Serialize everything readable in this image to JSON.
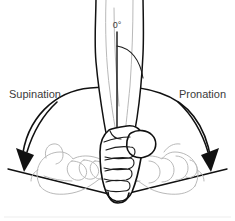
{
  "figure": {
    "background_color": "#ffffff",
    "line_color": "#111111",
    "ghost_color": "#b9b9b9",
    "text_color": "#3b3b3b"
  },
  "labels": {
    "left_motion": "Supination",
    "right_motion": "Pronation",
    "neutral_angle": "0°"
  },
  "annotations": {
    "neutral_axis_name": "vertical neutral reference line",
    "arc_name": "rotation range arc",
    "baseline_name": "horizontal ground reference line"
  },
  "anatomy": {
    "forearm": "forearm",
    "center_hand": "neutral-position fist",
    "left_hand": "supinated hand, palm up",
    "right_hand": "pronated hand, palm down"
  }
}
